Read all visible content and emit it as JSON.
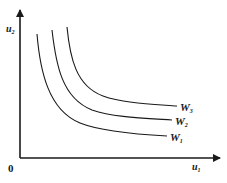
{
  "diagram": {
    "type": "indifference-curves",
    "axes": {
      "x_label": "u",
      "x_label_sub": "1",
      "y_label": "u",
      "y_label_sub": "2",
      "origin_label": "0"
    },
    "curves": [
      {
        "name": "W",
        "sub": "1",
        "order": 1
      },
      {
        "name": "W",
        "sub": "2",
        "order": 2
      },
      {
        "name": "W",
        "sub": "3",
        "order": 3
      }
    ],
    "colors": {
      "line": "#1a1a1a",
      "background": "#ffffff"
    }
  }
}
